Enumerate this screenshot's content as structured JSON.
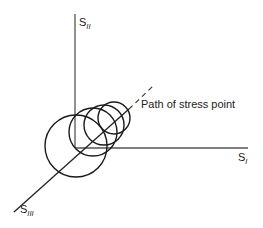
{
  "diagram": {
    "type": "stress-space-diagram",
    "axes": [
      {
        "id": "s2",
        "label_main": "S",
        "label_sub": "II",
        "direction": "vertical-up"
      },
      {
        "id": "s1",
        "label_main": "S",
        "label_sub": "I",
        "direction": "horizontal-right"
      },
      {
        "id": "s3",
        "label_main": "S",
        "label_sub": "III",
        "direction": "diagonal-down-left"
      }
    ],
    "annotation": "Path of stress point",
    "circles_count": 4,
    "colors": {
      "line": "#1a1a1a",
      "axis": "#555555",
      "background": "#ffffff"
    }
  }
}
